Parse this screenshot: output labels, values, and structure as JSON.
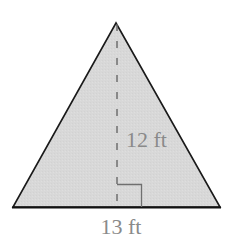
{
  "diagram": {
    "shape": "triangle",
    "fill_color": "#d9d9d9",
    "stroke_color": "#1a1a1a",
    "height_line_color": "#777777",
    "label_color": "#8a8a8a",
    "height_label": "12 ft",
    "base_label": "13 ft",
    "vertices": {
      "apex": [
        116,
        23
      ],
      "bottom_left": [
        13,
        207
      ],
      "bottom_right": [
        220,
        207
      ]
    },
    "right_angle_marker": true
  }
}
